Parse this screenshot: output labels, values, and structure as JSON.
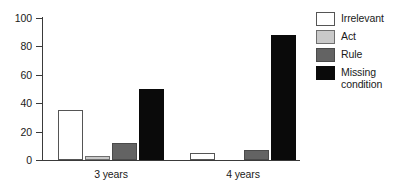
{
  "chart_data": {
    "type": "bar",
    "title": "",
    "subtitle": "",
    "xlabel": "",
    "ylabel": "",
    "categories": [
      "3 years",
      "4 years"
    ],
    "series": [
      {
        "name": "Irrelevant",
        "values": [
          35,
          5
        ],
        "color": "#ffffff"
      },
      {
        "name": "Act",
        "values": [
          3,
          0
        ],
        "color": "#c9c9c9"
      },
      {
        "name": "Rule",
        "values": [
          12,
          7
        ],
        "color": "#636363"
      },
      {
        "name": "Missing condition",
        "values": [
          50,
          88
        ],
        "color": "#0a0a0a"
      }
    ],
    "ylim": [
      0,
      100
    ],
    "yticks": [
      0,
      20,
      40,
      60,
      80,
      100
    ],
    "ytick_labels": [
      "0",
      "20",
      "40",
      "60",
      "80",
      "100"
    ],
    "grid": false,
    "legend_position": "right"
  },
  "legend": {
    "entries": [
      {
        "label": "Irrelevant",
        "swatch": "swatch-irrelevant"
      },
      {
        "label": "Act",
        "swatch": "swatch-act"
      },
      {
        "label": "Rule",
        "swatch": "swatch-rule"
      },
      {
        "label": "Missing condition",
        "swatch": "swatch-missing"
      }
    ]
  }
}
